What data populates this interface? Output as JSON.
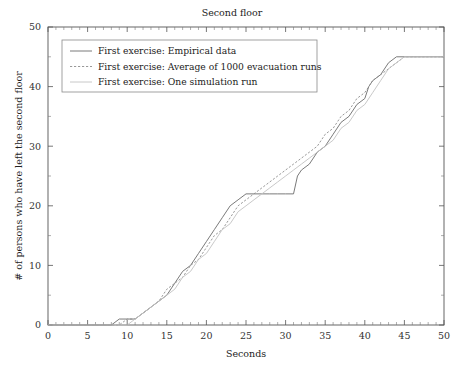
{
  "chart_data": {
    "type": "line",
    "title": "Second floor",
    "xlabel": "Seconds",
    "ylabel": "# of persons who have left the second floor",
    "xlim": [
      0,
      50
    ],
    "ylim": [
      0,
      50
    ],
    "xticks": [
      0,
      5,
      10,
      15,
      20,
      25,
      30,
      35,
      40,
      45,
      50
    ],
    "yticks": [
      0,
      10,
      20,
      30,
      40,
      50
    ],
    "xtick_labels": [
      "0",
      "5",
      "10",
      "15",
      "20",
      "25",
      "30",
      "35",
      "40",
      "45",
      "50"
    ],
    "ytick_labels": [
      "0",
      "10",
      "20",
      "30",
      "40",
      "50"
    ],
    "x_minor_step": 1,
    "y_minor_step": 5,
    "grid": false,
    "legend_position": "upper-left",
    "series": [
      {
        "name": "First exercise: Empirical data",
        "style": "solid",
        "color": "#6b6b6b",
        "points": [
          [
            0,
            0
          ],
          [
            8,
            0
          ],
          [
            9,
            1
          ],
          [
            10,
            1
          ],
          [
            11,
            1
          ],
          [
            12,
            2
          ],
          [
            13,
            3
          ],
          [
            14,
            4
          ],
          [
            15,
            5
          ],
          [
            16,
            7
          ],
          [
            17,
            9
          ],
          [
            18,
            10
          ],
          [
            19,
            12
          ],
          [
            20,
            14
          ],
          [
            21,
            16
          ],
          [
            22,
            18
          ],
          [
            23,
            20
          ],
          [
            24,
            21
          ],
          [
            25,
            22
          ],
          [
            26,
            22
          ],
          [
            27,
            22
          ],
          [
            28,
            22
          ],
          [
            29,
            22
          ],
          [
            30,
            22
          ],
          [
            31,
            22
          ],
          [
            31.5,
            25
          ],
          [
            32,
            26
          ],
          [
            33,
            27
          ],
          [
            34,
            29
          ],
          [
            35,
            30
          ],
          [
            36,
            32
          ],
          [
            37,
            34
          ],
          [
            38,
            35
          ],
          [
            39,
            37
          ],
          [
            40,
            38
          ],
          [
            40.5,
            40
          ],
          [
            41,
            41
          ],
          [
            42,
            42
          ],
          [
            43,
            44
          ],
          [
            44,
            45
          ],
          [
            45,
            45
          ],
          [
            50,
            45
          ]
        ]
      },
      {
        "name": "First exercise: Average of 1000 evacuation runs",
        "style": "dashed",
        "color": "#8d8d8d",
        "points": [
          [
            0,
            0
          ],
          [
            9,
            0
          ],
          [
            10,
            1
          ],
          [
            11,
            1
          ],
          [
            12,
            2
          ],
          [
            13,
            3
          ],
          [
            14,
            4
          ],
          [
            15,
            6
          ],
          [
            16,
            7
          ],
          [
            17,
            8
          ],
          [
            18,
            10
          ],
          [
            19,
            11
          ],
          [
            20,
            13
          ],
          [
            21,
            15
          ],
          [
            22,
            16
          ],
          [
            23,
            18
          ],
          [
            24,
            20
          ],
          [
            25,
            21
          ],
          [
            26,
            22
          ],
          [
            27,
            23
          ],
          [
            28,
            24
          ],
          [
            29,
            25
          ],
          [
            30,
            26
          ],
          [
            31,
            27
          ],
          [
            32,
            28
          ],
          [
            33,
            29
          ],
          [
            34,
            30
          ],
          [
            35,
            32
          ],
          [
            36,
            33
          ],
          [
            37,
            35
          ],
          [
            38,
            36
          ],
          [
            39,
            38
          ],
          [
            40,
            39
          ],
          [
            41,
            41
          ],
          [
            42,
            42
          ],
          [
            43,
            43
          ],
          [
            44,
            44
          ],
          [
            45,
            45
          ],
          [
            46,
            45
          ],
          [
            50,
            45
          ]
        ]
      },
      {
        "name": "First exercise: One simulation run",
        "style": "solid-light",
        "color": "#c2c2c2",
        "points": [
          [
            0,
            0
          ],
          [
            10,
            0
          ],
          [
            11,
            1
          ],
          [
            12,
            2
          ],
          [
            13,
            3
          ],
          [
            14,
            4
          ],
          [
            15,
            5
          ],
          [
            16,
            6
          ],
          [
            17,
            8
          ],
          [
            18,
            9
          ],
          [
            19,
            11
          ],
          [
            20,
            12
          ],
          [
            21,
            14
          ],
          [
            22,
            16
          ],
          [
            23,
            17
          ],
          [
            24,
            19
          ],
          [
            25,
            20
          ],
          [
            26,
            21
          ],
          [
            27,
            22
          ],
          [
            28,
            23
          ],
          [
            29,
            24
          ],
          [
            30,
            25
          ],
          [
            31,
            26
          ],
          [
            32,
            27
          ],
          [
            33,
            28
          ],
          [
            34,
            29
          ],
          [
            35,
            30
          ],
          [
            36,
            31
          ],
          [
            37,
            33
          ],
          [
            38,
            34
          ],
          [
            39,
            36
          ],
          [
            40,
            37
          ],
          [
            41,
            39
          ],
          [
            42,
            41
          ],
          [
            43,
            43
          ],
          [
            44,
            44
          ],
          [
            45,
            45
          ],
          [
            46,
            45
          ],
          [
            50,
            45
          ]
        ]
      }
    ]
  },
  "legend": {
    "items": [
      {
        "label": "First exercise: Empirical data",
        "style": "solid"
      },
      {
        "label": "First exercise: Average of 1000 evacuation runs",
        "style": "dashed"
      },
      {
        "label": "First exercise: One simulation run",
        "style": "solid-light"
      }
    ]
  }
}
